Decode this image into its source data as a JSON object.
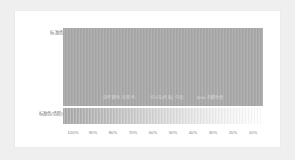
{
  "panel": {
    "background_color": "#efefef",
    "card_background": "#ffffff",
    "card_border_color": "#eceaea"
  },
  "rows": {
    "main": {
      "label": "标准色",
      "swatch_color": "#a9a9a9",
      "caption_segments": [
        "这些 颜色 标准 色",
        "可以在(色板) 中选",
        "Web 的颜色值"
      ]
    },
    "tint": {
      "label": "标准色(色阶)",
      "gradient_from": "#a9a9a9",
      "gradient_to": "#ffffff"
    }
  },
  "axis": {
    "ticks": [
      "100%",
      "90%",
      "80%",
      "70%",
      "60%",
      "50%",
      "40%",
      "30%",
      "20%",
      "10%"
    ],
    "tick_color": "#808080"
  }
}
